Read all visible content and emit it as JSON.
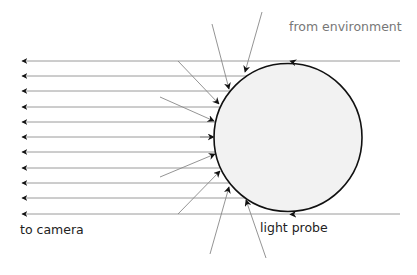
{
  "diagram": {
    "labels": {
      "from_environment": "from environment",
      "to_camera": "to camera",
      "light_probe": "light probe"
    },
    "colors": {
      "ray": "#9a9a9a",
      "ray_dark": "#888888",
      "probe_fill": "#f2f2f2",
      "probe_stroke": "#111111",
      "arrowhead": "#111111",
      "env_text": "#777777",
      "text": "#222222"
    },
    "probe": {
      "cx": 288,
      "cy": 137.5,
      "r": 74
    },
    "camera_rays_y": [
      61,
      76,
      91,
      107,
      122,
      137,
      152,
      168,
      183,
      198,
      214
    ],
    "camera_rays_x_start": 22,
    "env_lines": [
      {
        "y": 61,
        "x_end": 400
      },
      {
        "y": 214,
        "x_end": 400
      }
    ],
    "incoming_rays": [
      {
        "x1": 262,
        "y1": 12,
        "x2": 245,
        "y2": 72
      },
      {
        "x1": 212,
        "y1": 24,
        "x2": 229,
        "y2": 89
      },
      {
        "x1": 178,
        "y1": 61,
        "x2": 219,
        "y2": 104
      },
      {
        "x1": 160,
        "y1": 97,
        "x2": 214,
        "y2": 121
      },
      {
        "x1": 200,
        "y1": 137,
        "x2": 214,
        "y2": 137
      },
      {
        "x1": 160,
        "y1": 177,
        "x2": 215,
        "y2": 154
      },
      {
        "x1": 178,
        "y1": 214,
        "x2": 220,
        "y2": 171
      },
      {
        "x1": 210,
        "y1": 254,
        "x2": 229,
        "y2": 187
      },
      {
        "x1": 266,
        "y1": 258,
        "x2": 246,
        "y2": 200
      }
    ]
  }
}
